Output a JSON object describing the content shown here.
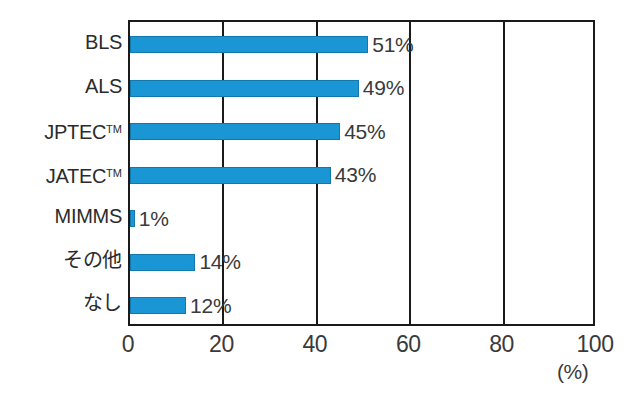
{
  "chart_data": {
    "type": "bar",
    "orientation": "horizontal",
    "title": "",
    "subtitle": "",
    "xlabel": "(%)",
    "ylabel": "",
    "xlim": [
      0,
      100
    ],
    "xticks": [
      "0",
      "20",
      "40",
      "60",
      "80",
      "100"
    ],
    "xtick_values": [
      0,
      20,
      40,
      60,
      80,
      100
    ],
    "grid": true,
    "grid_axis": "x",
    "legend": false,
    "legend_position": "none",
    "categories": [
      "BLS",
      "ALS",
      "JPTEC™",
      "JATEC™",
      "MIMMS",
      "その他",
      "なし"
    ],
    "values": [
      51,
      49,
      45,
      43,
      1,
      14,
      12
    ],
    "data_labels": [
      "51%",
      "49%",
      "45%",
      "43%",
      "1%",
      "14%",
      "12%"
    ],
    "bar_color": "#1b96d4",
    "bar_edge_color": "#1278ad",
    "axis_color": "#1a1a1a",
    "text_color": "#3a3a3a",
    "background_color": "#ffffff"
  },
  "axis": {
    "unit": "(%)"
  }
}
